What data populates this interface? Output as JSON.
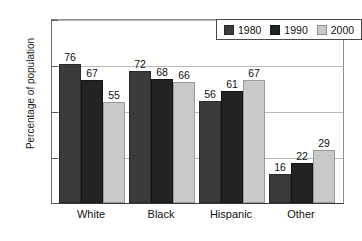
{
  "chart_data": {
    "type": "bar",
    "title": "",
    "xlabel": "",
    "ylabel": "Percentage of population",
    "categories": [
      "White",
      "Black",
      "Hispanic",
      "Other"
    ],
    "series": [
      {
        "name": "1980",
        "color": "#3b3b3b",
        "values": [
          76,
          72,
          56,
          16
        ]
      },
      {
        "name": "1990",
        "color": "#232323",
        "values": [
          67,
          68,
          61,
          22
        ]
      },
      {
        "name": "2000",
        "color": "#c9c9c9",
        "values": [
          55,
          66,
          67,
          29
        ]
      }
    ],
    "ylim": [
      0,
      100
    ],
    "yticks": [
      0,
      25,
      50,
      75,
      100
    ],
    "ytick_labels": [
      "0",
      "25",
      "50",
      "75",
      "100"
    ],
    "grid": true,
    "legend_position": "top-right",
    "data_labels": true
  },
  "axis": {
    "y_title": "Percentage of population",
    "y_ticks": [
      "100",
      "75",
      "50",
      "25",
      "0"
    ]
  },
  "legend": {
    "entries": [
      {
        "label": "1980",
        "swatch": "legend-swatch-1980"
      },
      {
        "label": "1990",
        "swatch": "legend-swatch-1990"
      },
      {
        "label": "2000",
        "swatch": "legend-swatch-2000"
      }
    ]
  }
}
